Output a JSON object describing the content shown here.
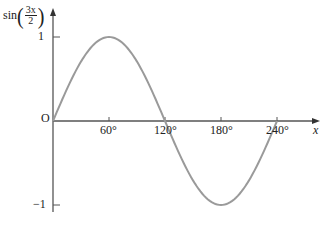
{
  "chart_data": {
    "type": "line",
    "title": "",
    "xlabel": "x",
    "ylabel": "sin(3x/2)",
    "ylabel_parts": {
      "func": "sin",
      "numerator": "3x",
      "denominator": "2"
    },
    "origin_label": "O",
    "x_ticks": [
      "60°",
      "120°",
      "180°",
      "240°"
    ],
    "x_tick_values": [
      60,
      120,
      180,
      240
    ],
    "y_ticks": [
      "1",
      "−1"
    ],
    "y_tick_values": [
      1,
      -1
    ],
    "xlim": [
      0,
      265
    ],
    "ylim": [
      -1,
      1
    ],
    "grid": false,
    "series": [
      {
        "name": "sin(3x/2)",
        "color": "#9a9a9a",
        "x": [
          0,
          30,
          60,
          90,
          120,
          150,
          180,
          210,
          240
        ],
        "values": [
          0,
          0.707,
          1,
          0.707,
          0,
          -0.707,
          -1,
          -0.707,
          0
        ]
      }
    ]
  },
  "colors": {
    "axis": "#555555",
    "curve": "#9a9a9a",
    "text": "#222222"
  }
}
